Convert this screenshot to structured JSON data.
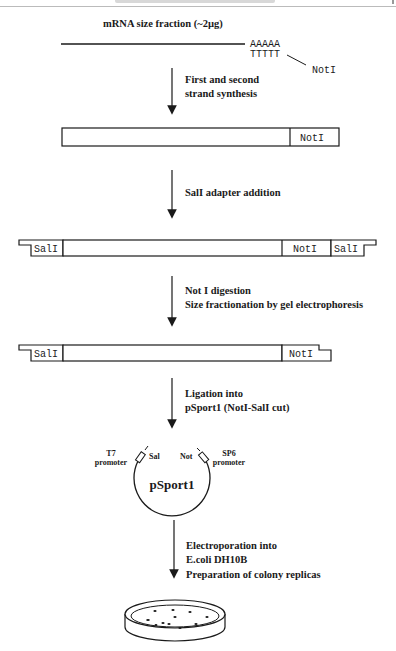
{
  "header": {
    "running_title": "",
    "page_mark": ""
  },
  "top": {
    "title": "mRNA size fraction (~2µg)",
    "polyA": "AAAAA",
    "polyT": "TTTTT",
    "primer_site": "NotI"
  },
  "steps": [
    {
      "lines": [
        "First and second",
        "strand synthesis"
      ]
    },
    {
      "lines": [
        "SalI adapter addition"
      ]
    },
    {
      "lines": [
        "Not I digestion",
        "Size fractionation by gel electrophoresis"
      ]
    },
    {
      "lines": [
        "Ligation into",
        "pSport1 (NotI-SalI cut)"
      ]
    },
    {
      "lines": [
        "Electroporation into",
        "E.coli DH10B",
        "Preparation of colony replicas"
      ]
    }
  ],
  "constructs": {
    "ds_cdna": {
      "right_site": "NotI"
    },
    "adapted": {
      "left_site": "SalI",
      "mid_site": "NotI",
      "right_site": "SalI"
    },
    "digested": {
      "left_site": "SalI",
      "right_site": "NotI"
    }
  },
  "plasmid": {
    "name": "pSport1",
    "left_site": "Sal",
    "right_site": "Not",
    "left_promoter": [
      "T7",
      "promoter"
    ],
    "right_promoter": [
      "SP6",
      "promoter"
    ]
  },
  "colors": {
    "ink": "#1a1a1a",
    "background": "#ffffff"
  }
}
